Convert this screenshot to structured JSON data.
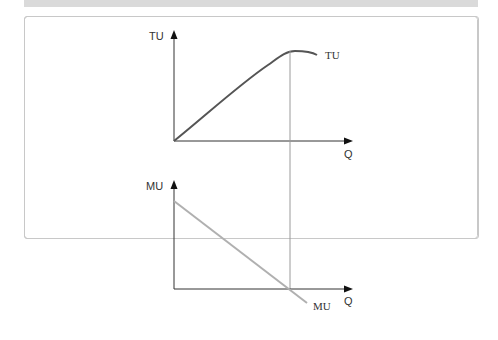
{
  "header": {
    "title": "",
    "color": "#d9d9d9"
  },
  "diagram": {
    "top_graph": {
      "y_axis_label": "TU",
      "x_axis_label": "Q",
      "curve_label": "TU",
      "curve_color": "#555555"
    },
    "bottom_graph": {
      "y_axis_label": "MU",
      "x_axis_label": "Q",
      "curve_label": "MU",
      "curve_color": "#b0b0b0"
    },
    "guide_line_color": "#9a9a9a"
  }
}
